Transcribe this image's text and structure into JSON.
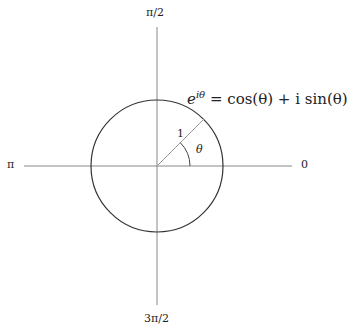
{
  "diagram": {
    "axis_labels": {
      "top": "π/2",
      "left": "π",
      "right": "0",
      "bottom": "3π/2"
    },
    "radius_label": "1",
    "angle_label": "θ",
    "formula": {
      "base": "e",
      "exponent": "iθ",
      "rhs": "= cos(θ) + i sin(θ)"
    },
    "colors": {
      "axis": "#888888",
      "circle": "#333333",
      "radius": "#999999",
      "text": "#222222"
    }
  }
}
